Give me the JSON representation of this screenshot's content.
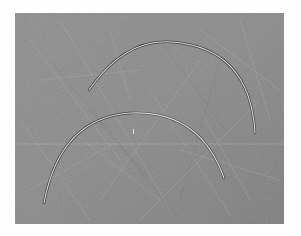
{
  "image": {
    "description": "Two curved arc-shaped metal wires lying on a scratched gray surface",
    "background_color": "#fdfdfd",
    "surface": {
      "base_color": "#8a8a8a",
      "light_color": "#a8a8a8",
      "dark_color": "#6e6e6e"
    },
    "wires": [
      {
        "name": "upper-wire",
        "start": [
          89,
          90
        ],
        "control": [
          165,
          5
        ],
        "end": [
          255,
          133
        ],
        "color": "#d8d8d8",
        "shadow": "#3c3c3c"
      },
      {
        "name": "lower-wire",
        "start": [
          44,
          203
        ],
        "control": [
          110,
          60
        ],
        "end": [
          224,
          178
        ],
        "color": "#d8d8d8",
        "shadow": "#3c3c3c"
      }
    ]
  }
}
